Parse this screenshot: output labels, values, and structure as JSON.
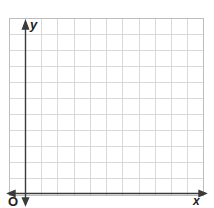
{
  "diagram": {
    "type": "coordinate-grid",
    "labels": {
      "y_axis": "y",
      "x_axis": "x",
      "origin": "O"
    },
    "grid": {
      "columns": 12,
      "rows": 11,
      "cell_px": 16.3
    },
    "colors": {
      "grid": "#d6d6d6",
      "border": "#bdbdbd",
      "axis": "#3a3a3a",
      "background": "#ffffff"
    }
  }
}
